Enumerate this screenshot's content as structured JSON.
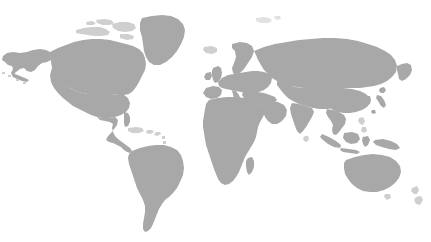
{
  "map": {
    "kind": "world-map-silhouette",
    "projection": "equirectangular",
    "width": 431,
    "height": 242,
    "background_color": "#ffffff",
    "land_color": "#a8a8a8",
    "land_color_faint": "#cfcfcf",
    "land_color_very_faint": "#e2e2e2",
    "has_labels": false,
    "has_borders": false,
    "has_graticule": false,
    "has_legend": false,
    "has_ui_chrome": false,
    "regions": [
      {
        "name": "alaska",
        "label": "Alaska",
        "tone": "land"
      },
      {
        "name": "canada",
        "label": "Canada",
        "tone": "land"
      },
      {
        "name": "greenland",
        "label": "Greenland",
        "tone": "land"
      },
      {
        "name": "canadian-arctic-islands",
        "label": "Canadian Arctic Archipelago",
        "tone": "faint"
      },
      {
        "name": "united-states",
        "label": "United States",
        "tone": "land"
      },
      {
        "name": "mexico-central-america",
        "label": "Mexico and Central America",
        "tone": "land"
      },
      {
        "name": "caribbean-islands",
        "label": "Caribbean Islands",
        "tone": "faint"
      },
      {
        "name": "south-america",
        "label": "South America",
        "tone": "land"
      },
      {
        "name": "iceland",
        "label": "Iceland",
        "tone": "faint"
      },
      {
        "name": "british-isles",
        "label": "British Isles",
        "tone": "land"
      },
      {
        "name": "scandinavia",
        "label": "Scandinavia",
        "tone": "land"
      },
      {
        "name": "europe",
        "label": "Europe",
        "tone": "land"
      },
      {
        "name": "svalbard",
        "label": "Svalbard",
        "tone": "very-faint"
      },
      {
        "name": "africa",
        "label": "Africa",
        "tone": "land"
      },
      {
        "name": "madagascar",
        "label": "Madagascar",
        "tone": "land"
      },
      {
        "name": "arabian-peninsula",
        "label": "Arabian Peninsula",
        "tone": "land"
      },
      {
        "name": "russia-siberia",
        "label": "Russia and Siberia",
        "tone": "land"
      },
      {
        "name": "central-asia",
        "label": "Central Asia",
        "tone": "land"
      },
      {
        "name": "india",
        "label": "India",
        "tone": "land"
      },
      {
        "name": "china-east-asia",
        "label": "China and East Asia",
        "tone": "land"
      },
      {
        "name": "japan",
        "label": "Japan",
        "tone": "land"
      },
      {
        "name": "southeast-asia",
        "label": "Southeast Asia",
        "tone": "land"
      },
      {
        "name": "indonesia",
        "label": "Indonesia",
        "tone": "land"
      },
      {
        "name": "philippines",
        "label": "Philippines",
        "tone": "faint"
      },
      {
        "name": "new-guinea",
        "label": "New Guinea",
        "tone": "land"
      },
      {
        "name": "australia",
        "label": "Australia",
        "tone": "land"
      },
      {
        "name": "new-zealand",
        "label": "New Zealand",
        "tone": "faint"
      },
      {
        "name": "sri-lanka",
        "label": "Sri Lanka",
        "tone": "faint"
      },
      {
        "name": "kamchatka",
        "label": "Kamchatka",
        "tone": "land"
      }
    ]
  }
}
